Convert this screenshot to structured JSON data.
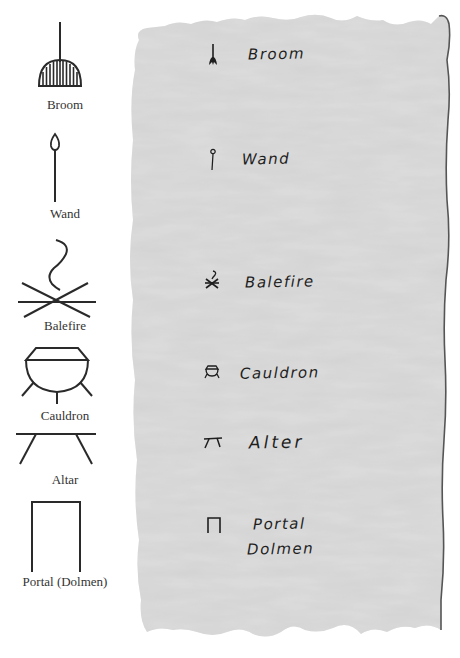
{
  "legend": {
    "items": [
      {
        "icon": "broom-icon",
        "label": "Broom"
      },
      {
        "icon": "wand-icon",
        "label": "Wand"
      },
      {
        "icon": "balefire-icon",
        "label": "Balefire"
      },
      {
        "icon": "cauldron-icon",
        "label": "Cauldron"
      },
      {
        "icon": "altar-icon",
        "label": "Altar"
      },
      {
        "icon": "portal-dolmen-icon",
        "label": "Portal (Dolmen)"
      }
    ]
  },
  "paper": {
    "color": "#d2d2d2",
    "edge_color": "#555555",
    "ink_color": "#1e1e1e",
    "entries": [
      {
        "glyph": "broom-glyph-icon",
        "text": "Broom"
      },
      {
        "glyph": "wand-glyph-icon",
        "text": "Wand"
      },
      {
        "glyph": "balefire-glyph-icon",
        "text": "Balefire"
      },
      {
        "glyph": "cauldron-glyph-icon",
        "text": "Cauldron"
      },
      {
        "glyph": "altar-glyph-icon",
        "text": "Alter"
      },
      {
        "glyph": "portal-glyph-icon",
        "text_line1": "Portal",
        "text_line2": "Dolmen"
      }
    ]
  }
}
